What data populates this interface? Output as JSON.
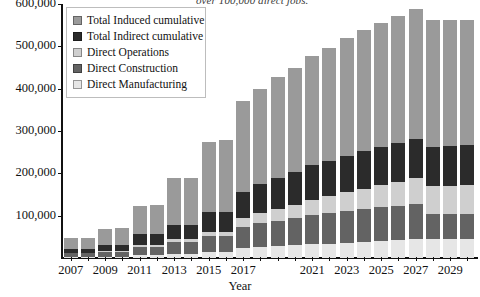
{
  "annotation": {
    "text": "over 100,000 direct jobs."
  },
  "axis": {
    "x_title": "Year",
    "y_ticks": [
      "100,000",
      "200,000",
      "300,000",
      "400,000",
      "500,000",
      "600,000"
    ],
    "x_labels": [
      "2007",
      "2009",
      "2011",
      "2013",
      "2015",
      "2017",
      "2021",
      "2023",
      "2025",
      "2027",
      "2029"
    ]
  },
  "legend": {
    "items": [
      {
        "label": "Total Induced cumulative",
        "color": "#9a9a9a"
      },
      {
        "label": "Total Indirect cumulative",
        "color": "#2b2b2b"
      },
      {
        "label": "Direct Operations",
        "color": "#cfcfcf"
      },
      {
        "label": "Direct Construction",
        "color": "#636363"
      },
      {
        "label": "Direct Manufacturing",
        "color": "#e6e6e6"
      }
    ]
  },
  "chart_data": {
    "type": "bar",
    "title": "",
    "subtitle": "",
    "xlabel": "Year",
    "ylabel": "",
    "ylim": [
      0,
      600000
    ],
    "ytick_step": 100000,
    "grid": false,
    "stacked": true,
    "legend_position": "top-left",
    "categories": [
      "2007",
      "2008",
      "2009",
      "2010",
      "2011",
      "2012",
      "2013",
      "2014",
      "2015",
      "2016",
      "2017",
      "2018",
      "2019",
      "2020",
      "2021",
      "2022",
      "2023",
      "2024",
      "2025",
      "2026",
      "2027",
      "2028",
      "2029",
      "2030"
    ],
    "series": [
      {
        "name": "Direct Manufacturing",
        "color": "#e6e6e6",
        "values": [
          2000,
          2000,
          3000,
          3000,
          6000,
          6000,
          10000,
          10000,
          14000,
          14000,
          24000,
          26000,
          28000,
          30000,
          32000,
          34000,
          36000,
          38000,
          40000,
          42000,
          44000,
          45000,
          46000,
          46000
        ]
      },
      {
        "name": "Direct Construction",
        "color": "#636363",
        "values": [
          9000,
          9000,
          12000,
          12000,
          20000,
          20000,
          28000,
          28000,
          38000,
          38000,
          50000,
          56000,
          60000,
          64000,
          70000,
          72000,
          76000,
          78000,
          80000,
          82000,
          84000,
          60000,
          58000,
          58000
        ]
      },
      {
        "name": "Direct Operations",
        "color": "#cfcfcf",
        "values": [
          1000,
          1000,
          2000,
          2000,
          4000,
          4000,
          6000,
          6000,
          10000,
          10000,
          20000,
          24000,
          28000,
          32000,
          36000,
          40000,
          44000,
          48000,
          52000,
          56000,
          60000,
          64000,
          66000,
          68000
        ]
      },
      {
        "name": "Total Indirect cumulative",
        "color": "#2b2b2b",
        "values": [
          10000,
          10000,
          14000,
          14000,
          26000,
          26000,
          34000,
          34000,
          46000,
          46000,
          62000,
          70000,
          74000,
          78000,
          82000,
          84000,
          86000,
          88000,
          90000,
          92000,
          94000,
          94000,
          94000,
          94000
        ]
      },
      {
        "name": "Total Induced cumulative",
        "color": "#9a9a9a",
        "values": [
          26000,
          26000,
          37000,
          39000,
          66000,
          70000,
          110000,
          112000,
          166000,
          170000,
          216000,
          224000,
          238000,
          246000,
          258000,
          266000,
          278000,
          286000,
          294000,
          300000,
          306000,
          300000,
          298000,
          296000
        ]
      }
    ],
    "totals": [
      48000,
      48000,
      68000,
      70000,
      122000,
      126000,
      188000,
      190000,
      274000,
      278000,
      372000,
      400000,
      428000,
      450000,
      478000,
      496000,
      520000,
      538000,
      556000,
      572000,
      588000,
      563000,
      562000,
      562000
    ]
  }
}
